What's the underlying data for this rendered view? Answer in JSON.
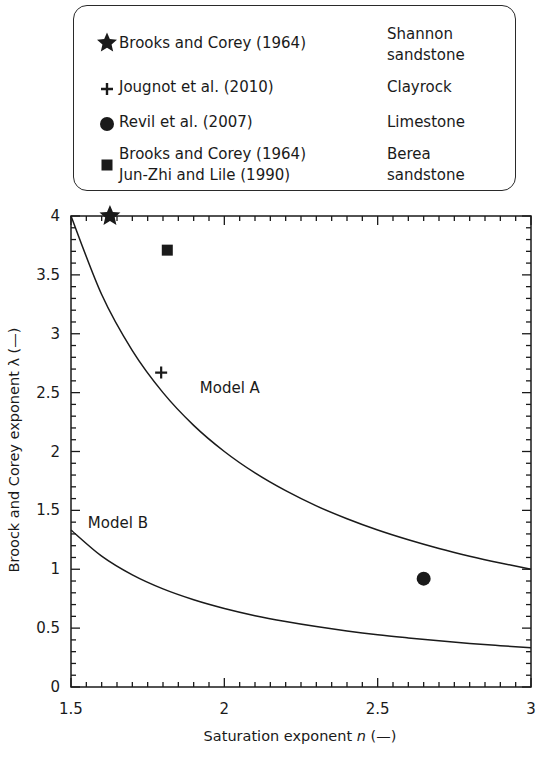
{
  "chart_data": {
    "type": "scatter",
    "title": "",
    "xlabel": "Saturation exponent n (—)",
    "xlabel_parts": {
      "before": "Saturation exponent ",
      "var": "n",
      "after": " (—)"
    },
    "ylabel": "Broock and Corey exponent λ (—)",
    "xlim": [
      1.5,
      3
    ],
    "ylim": [
      0,
      4
    ],
    "x_major_ticks": [
      1.5,
      2,
      2.5,
      3
    ],
    "x_tick_labels": [
      "1.5",
      "2",
      "2.5",
      "3"
    ],
    "x_minor_step": 0.05,
    "y_major_ticks": [
      0,
      0.5,
      1,
      1.5,
      2,
      2.5,
      3,
      3.5,
      4
    ],
    "y_tick_labels": [
      "0",
      "0.5",
      "1",
      "1.5",
      "2",
      "2.5",
      "3",
      "3.5",
      "4"
    ],
    "y_minor_step": 0.1,
    "grid": false,
    "legend_position": "top (above plot, boxed)",
    "series": [
      {
        "name": "Model A",
        "kind": "line",
        "x": [
          1.5,
          1.6,
          1.7,
          1.8,
          1.9,
          2.0,
          2.1,
          2.2,
          2.3,
          2.4,
          2.5,
          2.6,
          2.7,
          2.8,
          2.9,
          3.0
        ],
        "y": [
          4.0,
          3.333,
          2.857,
          2.5,
          2.222,
          2.0,
          1.818,
          1.667,
          1.538,
          1.429,
          1.333,
          1.25,
          1.176,
          1.111,
          1.053,
          1.0
        ],
        "label_pos": {
          "x": 1.92,
          "y": 2.5
        }
      },
      {
        "name": "Model B",
        "kind": "line",
        "x": [
          1.5,
          1.6,
          1.7,
          1.8,
          1.9,
          2.0,
          2.1,
          2.2,
          2.3,
          2.4,
          2.5,
          2.6,
          2.7,
          2.8,
          2.9,
          3.0
        ],
        "y": [
          1.333,
          1.111,
          0.952,
          0.833,
          0.741,
          0.667,
          0.606,
          0.556,
          0.513,
          0.476,
          0.444,
          0.417,
          0.392,
          0.37,
          0.351,
          0.333
        ],
        "label_pos": {
          "x": 1.555,
          "y": 1.35
        }
      },
      {
        "name": "Brooks and Corey (1964) — Shannon sandstone",
        "kind": "point",
        "marker": "star",
        "x": [
          1.627
        ],
        "y": [
          4.0
        ]
      },
      {
        "name": "Jougnot et al. (2010) — Clayrock",
        "kind": "point",
        "marker": "plus",
        "x": [
          1.794
        ],
        "y": [
          2.67
        ]
      },
      {
        "name": "Revil et al. (2007) — Limestone",
        "kind": "point",
        "marker": "circle",
        "x": [
          2.65
        ],
        "y": [
          0.92
        ]
      },
      {
        "name": "Brooks and Corey (1964); Jun-Zhi and Lile (1990) — Berea sandstone",
        "kind": "point",
        "marker": "square",
        "x": [
          1.814
        ],
        "y": [
          3.71
        ]
      }
    ]
  },
  "legend": {
    "entries": [
      {
        "marker": "star",
        "source": "Brooks and Corey (1964)",
        "material": "Shannon\nsandstone"
      },
      {
        "marker": "plus",
        "source": "Jougnot et al. (2010)",
        "material": "Clayrock"
      },
      {
        "marker": "circle",
        "source": "Revil et al. (2007)",
        "material": "Limestone"
      },
      {
        "marker": "square",
        "source": "Brooks and Corey (1964)\nJun-Zhi and Lile (1990)",
        "material": "Berea\nsandstone"
      }
    ]
  },
  "colors": {
    "ink": "#1a1a1a",
    "background": "#ffffff"
  }
}
